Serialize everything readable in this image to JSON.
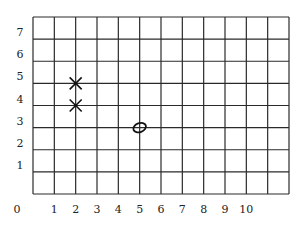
{
  "grid": {
    "columns": 12,
    "rows": 8,
    "left": 33,
    "top": 17,
    "right": 289,
    "bottom": 194,
    "line_color": "#2a2a2a"
  },
  "axis": {
    "origin_label": "0",
    "x_ticks": [
      "1",
      "2",
      "3",
      "4",
      "5",
      "6",
      "7",
      "8",
      "9",
      "10"
    ],
    "y_ticks": [
      "1",
      "2",
      "3",
      "4",
      "5",
      "6",
      "7"
    ]
  },
  "marks": [
    {
      "type": "cross",
      "symbol": "X",
      "x": 2,
      "y": 5
    },
    {
      "type": "cross",
      "symbol": "X",
      "x": 2,
      "y": 4
    },
    {
      "type": "circle",
      "symbol": "O",
      "x": 5,
      "y": 3
    }
  ]
}
